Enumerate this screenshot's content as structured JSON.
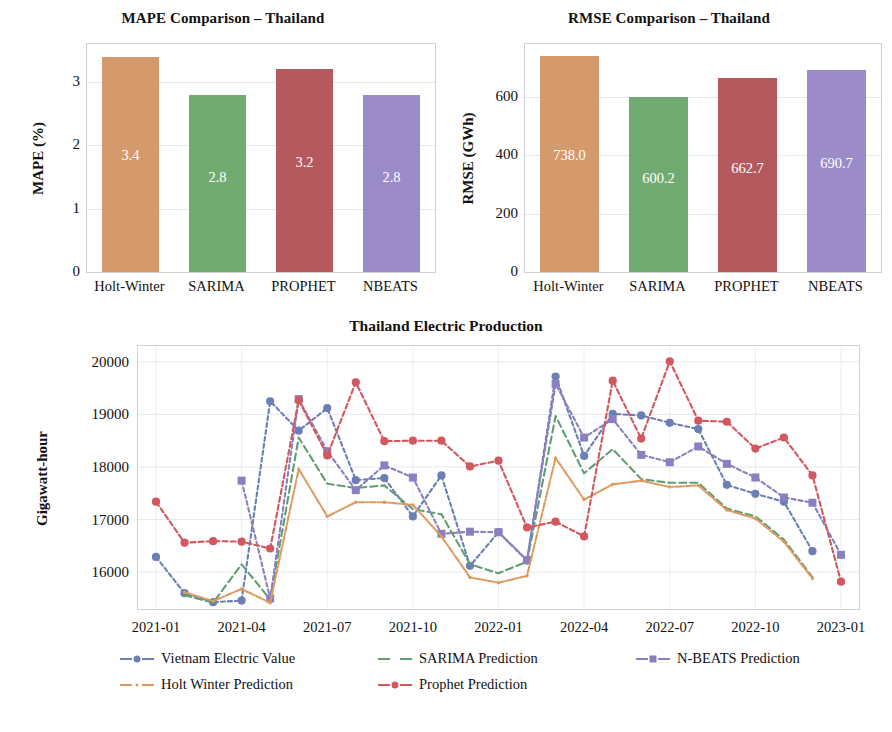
{
  "figure": {
    "panels": [
      "mape-bar",
      "rmse-bar",
      "timeseries-line"
    ]
  },
  "chart_data": [
    {
      "type": "bar",
      "title": "MAPE Comparison – Thailand",
      "xlabel": "",
      "ylabel": "MAPE (%)",
      "categories": [
        "Holt-Winter",
        "SARIMA",
        "PROPHET",
        "NBEATS"
      ],
      "values": [
        3.4,
        2.8,
        3.2,
        2.8
      ],
      "value_labels": [
        "3.4",
        "2.8",
        "3.2",
        "2.8"
      ],
      "colors": [
        "#d59a6c",
        "#72ab72",
        "#b45a5e",
        "#9b8cc9"
      ],
      "ylim": [
        0,
        3.6
      ],
      "yticks": [
        0,
        1,
        2,
        3
      ],
      "ytick_labels": [
        "0",
        "1",
        "2",
        "3"
      ],
      "grid": true,
      "legend": "none"
    },
    {
      "type": "bar",
      "title": "RMSE Comparison – Thailand",
      "xlabel": "",
      "ylabel": "RMSE (GWh)",
      "categories": [
        "Holt-Winter",
        "SARIMA",
        "PROPHET",
        "NBEATS"
      ],
      "values": [
        738.0,
        600.2,
        662.7,
        690.7
      ],
      "value_labels": [
        "738.0",
        "600.2",
        "662.7",
        "690.7"
      ],
      "colors": [
        "#d59a6c",
        "#72ab72",
        "#b45a5e",
        "#9b8cc9"
      ],
      "ylim": [
        0,
        780
      ],
      "yticks": [
        0,
        200,
        400,
        600
      ],
      "ytick_labels": [
        "0",
        "200",
        "400",
        "600"
      ],
      "grid": true,
      "legend": "none"
    },
    {
      "type": "line",
      "title": "Thailand Electric Production",
      "xlabel": "",
      "ylabel": "Gigawatt-hour",
      "ylim": [
        15300,
        20300
      ],
      "yticks": [
        16000,
        17000,
        18000,
        19000,
        20000
      ],
      "ytick_labels": [
        "16000",
        "17000",
        "18000",
        "19000",
        "20000"
      ],
      "xticks": [
        "2021-01",
        "2021-04",
        "2021-07",
        "2021-10",
        "2022-01",
        "2022-04",
        "2022-07",
        "2022-10",
        "2023-01"
      ],
      "x": [
        "2021-01",
        "2021-02",
        "2021-03",
        "2021-04",
        "2021-05",
        "2021-06",
        "2021-07",
        "2021-08",
        "2021-09",
        "2021-10",
        "2021-11",
        "2021-12",
        "2022-01",
        "2022-02",
        "2022-03",
        "2022-04",
        "2022-05",
        "2022-06",
        "2022-07",
        "2022-08",
        "2022-09",
        "2022-10",
        "2022-11",
        "2022-12",
        "2023-01"
      ],
      "grid": true,
      "legend": "bottom",
      "series": [
        {
          "name": "Vietnam Electric Value",
          "color": "#6b7fb5",
          "marker": "circle",
          "dash": "4,3",
          "values": [
            16290,
            15600,
            15430,
            15460,
            19250,
            18690,
            19120,
            17750,
            17790,
            17060,
            17840,
            16120,
            16760,
            16220,
            19720,
            18210,
            19010,
            18980,
            18840,
            18720,
            17660,
            17490,
            17340,
            16400,
            null
          ]
        },
        {
          "name": "SARIMA Prediction",
          "color": "#5f9e72",
          "marker": "none",
          "dash": "7,4",
          "values": [
            null,
            15560,
            15420,
            16150,
            15480,
            18560,
            17680,
            17600,
            17650,
            17200,
            17100,
            16150,
            15980,
            16200,
            18970,
            17880,
            18340,
            17770,
            17700,
            17700,
            17210,
            17060,
            16620,
            15900,
            null
          ]
        },
        {
          "name": "N-BEATS Prediction",
          "color": "#8a80c0",
          "marker": "square",
          "dash": "4,3",
          "values": [
            null,
            null,
            null,
            17740,
            15500,
            19290,
            18300,
            17560,
            18030,
            17800,
            16730,
            16770,
            16760,
            16230,
            19580,
            18560,
            18910,
            18230,
            18090,
            18390,
            18060,
            17800,
            17420,
            17320,
            16330
          ]
        },
        {
          "name": "Holt Winter Prediction",
          "color": "#dd9a5e",
          "marker": "dot",
          "dash": "6,2,1,2",
          "values": [
            null,
            15620,
            15450,
            15680,
            15420,
            17960,
            17060,
            17330,
            17330,
            17280,
            16680,
            15900,
            15800,
            15930,
            18170,
            17380,
            17670,
            17740,
            17620,
            17650,
            17180,
            17020,
            16580,
            15880,
            null
          ]
        },
        {
          "name": "Prophet Prediction",
          "color": "#d1585f",
          "marker": "circle",
          "dash": "5,3",
          "values": [
            17340,
            16560,
            16590,
            16580,
            16450,
            19270,
            18220,
            19610,
            18490,
            18500,
            18500,
            18010,
            18120,
            16850,
            16960,
            16680,
            19640,
            18540,
            20010,
            18880,
            18860,
            18350,
            18560,
            17840,
            15820
          ]
        }
      ]
    }
  ]
}
